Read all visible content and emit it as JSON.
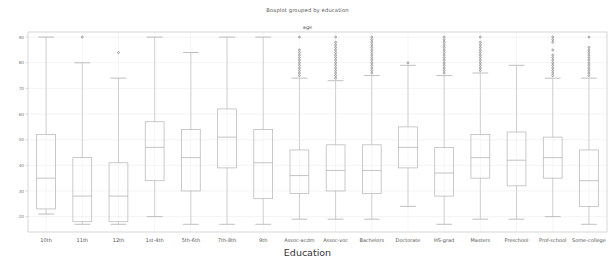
{
  "chart_data": {
    "type": "box",
    "title": "Boxplot grouped by education",
    "subtitle": "age",
    "xlabel": "Education",
    "ylabel": "",
    "ylim": [
      14,
      92
    ],
    "yticks": [
      20,
      30,
      40,
      50,
      60,
      70,
      80,
      90
    ],
    "grid": true,
    "legend": "none",
    "categories": [
      "10th",
      "11th",
      "12th",
      "1st-4th",
      "5th-6th",
      "7th-8th",
      "9th",
      "Assoc-acdm",
      "Assoc-voc",
      "Bachelors",
      "Doctorate",
      "HS-grad",
      "Masters",
      "Preschool",
      "Prof-school",
      "Some-college"
    ],
    "boxes": [
      {
        "label": "10th",
        "whisker_low": 21,
        "q1": 23,
        "median": 35,
        "q3": 52,
        "whisker_high": 90,
        "outliers": []
      },
      {
        "label": "11th",
        "whisker_low": 17,
        "q1": 18,
        "median": 28,
        "q3": 43,
        "whisker_high": 80,
        "outliers": [
          90
        ]
      },
      {
        "label": "12th",
        "whisker_low": 17,
        "q1": 18,
        "median": 28,
        "q3": 41,
        "whisker_high": 74,
        "outliers": [
          84
        ]
      },
      {
        "label": "1st-4th",
        "whisker_low": 20,
        "q1": 34,
        "median": 47,
        "q3": 57,
        "whisker_high": 90,
        "outliers": []
      },
      {
        "label": "5th-6th",
        "whisker_low": 17,
        "q1": 30,
        "median": 43,
        "q3": 54,
        "whisker_high": 84,
        "outliers": []
      },
      {
        "label": "7th-8th",
        "whisker_low": 17,
        "q1": 39,
        "median": 51,
        "q3": 62,
        "whisker_high": 90,
        "outliers": []
      },
      {
        "label": "9th",
        "whisker_low": 17,
        "q1": 27,
        "median": 41,
        "q3": 54,
        "whisker_high": 90,
        "outliers": []
      },
      {
        "label": "Assoc-acdm",
        "whisker_low": 19,
        "q1": 29,
        "median": 36,
        "q3": 46,
        "whisker_high": 74,
        "outliers": [
          75,
          76,
          77,
          78,
          79,
          80,
          81,
          82,
          83,
          84,
          85,
          90
        ]
      },
      {
        "label": "Assoc-voc",
        "whisker_low": 19,
        "q1": 30,
        "median": 38,
        "q3": 48,
        "whisker_high": 73,
        "outliers": [
          74,
          75,
          76,
          77,
          78,
          79,
          80,
          81,
          82,
          83,
          84,
          85,
          86,
          87,
          88,
          90
        ]
      },
      {
        "label": "Bachelors",
        "whisker_low": 19,
        "q1": 29,
        "median": 38,
        "q3": 48,
        "whisker_high": 75,
        "outliers": [
          76,
          77,
          78,
          79,
          80,
          81,
          82,
          83,
          84,
          85,
          86,
          87,
          88,
          89,
          90
        ]
      },
      {
        "label": "Doctorate",
        "whisker_low": 24,
        "q1": 39,
        "median": 47,
        "q3": 55,
        "whisker_high": 79,
        "outliers": [
          80
        ]
      },
      {
        "label": "HS-grad",
        "whisker_low": 17,
        "q1": 28,
        "median": 37,
        "q3": 47,
        "whisker_high": 75,
        "outliers": [
          76,
          77,
          78,
          79,
          80,
          81,
          82,
          83,
          84,
          85,
          86,
          87,
          88,
          89,
          90
        ]
      },
      {
        "label": "Masters",
        "whisker_low": 19,
        "q1": 35,
        "median": 43,
        "q3": 52,
        "whisker_high": 76,
        "outliers": [
          77,
          78,
          79,
          80,
          81,
          82,
          83,
          84,
          85,
          86,
          87,
          88,
          90
        ]
      },
      {
        "label": "Preschool",
        "whisker_low": 19,
        "q1": 32,
        "median": 42,
        "q3": 53,
        "whisker_high": 79,
        "outliers": []
      },
      {
        "label": "Prof-school",
        "whisker_low": 20,
        "q1": 35,
        "median": 43,
        "q3": 51,
        "whisker_high": 74,
        "outliers": [
          75,
          76,
          77,
          78,
          79,
          80,
          81,
          82,
          83,
          85,
          88,
          89,
          90
        ]
      },
      {
        "label": "Some-college",
        "whisker_low": 17,
        "q1": 24,
        "median": 34,
        "q3": 46,
        "whisker_high": 74,
        "outliers": [
          75,
          76,
          77,
          78,
          79,
          80,
          81,
          82,
          83,
          84,
          85,
          86,
          90
        ]
      }
    ]
  },
  "style": {
    "box_line_color": "#b8b8b8",
    "median_line_color": "#b0b0b0",
    "whisker_color": "#c0c0c0",
    "outlier_color": "#777777",
    "grid_color": "#ececec",
    "axis_color": "#cccccc",
    "background": "#ffffff"
  }
}
